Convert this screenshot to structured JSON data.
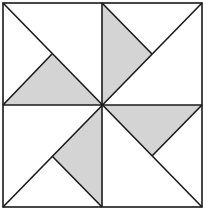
{
  "diagram": {
    "type": "pinwheel",
    "colors": {
      "shade": "#d4d4d4",
      "background": "#ffffff",
      "stroke": "#1a1a1a"
    },
    "square": {
      "x1": 3,
      "y1": 3,
      "x2": 202,
      "y2": 207
    },
    "center": {
      "x": 102,
      "y": 105
    },
    "shaded_triangles": [
      {
        "name": "top-left-shaded",
        "points": "3,105 102,105 52,54"
      },
      {
        "name": "top-right-shaded",
        "points": "102,3 102,105 152,54"
      },
      {
        "name": "bottom-left-shaded",
        "points": "102,105 102,207 52,156"
      },
      {
        "name": "bottom-right-shaded",
        "points": "102,105 202,105 152,156"
      }
    ],
    "lines": [
      {
        "name": "diagonal-top-left",
        "x1": 3,
        "y1": 3,
        "x2": 202,
        "y2": 207
      },
      {
        "name": "diagonal-top-right",
        "x1": 202,
        "y1": 3,
        "x2": 3,
        "y2": 207
      },
      {
        "name": "vertical-mid",
        "x1": 102,
        "y1": 3,
        "x2": 102,
        "y2": 207
      },
      {
        "name": "horizontal-mid",
        "x1": 3,
        "y1": 105,
        "x2": 202,
        "y2": 105
      },
      {
        "name": "inner-tl",
        "x1": 3,
        "y1": 105,
        "x2": 52,
        "y2": 54
      },
      {
        "name": "inner-tr",
        "x1": 102,
        "y1": 3,
        "x2": 152,
        "y2": 54
      },
      {
        "name": "inner-bl",
        "x1": 102,
        "y1": 207,
        "x2": 52,
        "y2": 156
      },
      {
        "name": "inner-br",
        "x1": 202,
        "y1": 105,
        "x2": 152,
        "y2": 156
      }
    ]
  }
}
